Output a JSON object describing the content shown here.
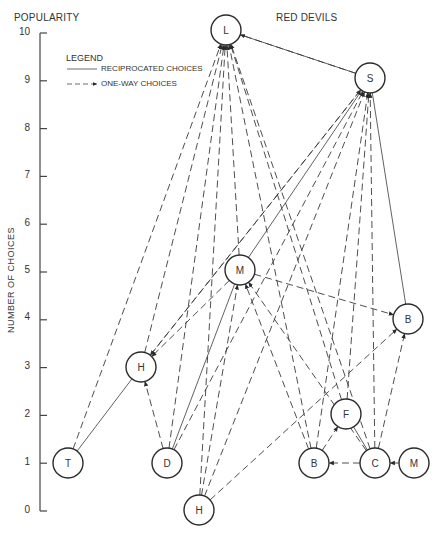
{
  "header": {
    "left_title": "POPULARITY",
    "right_title": "RED DEVILS"
  },
  "axis": {
    "title": "NUMBER OF CHOICES",
    "ticks": [
      "0",
      "1",
      "2",
      "3",
      "4",
      "5",
      "6",
      "7",
      "8",
      "9",
      "10"
    ]
  },
  "legend": {
    "title": "LEGEND",
    "reciprocated": "RECIPROCATED CHOICES",
    "one_way": "ONE-WAY CHOICES"
  },
  "nodes": [
    {
      "id": "L",
      "label": "L",
      "choices": 10
    },
    {
      "id": "S",
      "label": "S",
      "choices": 9
    },
    {
      "id": "M1",
      "label": "M",
      "choices": 5
    },
    {
      "id": "B1",
      "label": "B",
      "choices": 4
    },
    {
      "id": "H1",
      "label": "H",
      "choices": 3
    },
    {
      "id": "F",
      "label": "F",
      "choices": 2
    },
    {
      "id": "T",
      "label": "T",
      "choices": 1
    },
    {
      "id": "D",
      "label": "D",
      "choices": 1
    },
    {
      "id": "B2",
      "label": "B",
      "choices": 1
    },
    {
      "id": "C",
      "label": "C",
      "choices": 1
    },
    {
      "id": "M2",
      "label": "M",
      "choices": 1
    },
    {
      "id": "H2",
      "label": "H",
      "choices": 0
    }
  ],
  "edges": {
    "reciprocated": [
      [
        "L",
        "S"
      ],
      [
        "T",
        "H1"
      ],
      [
        "S",
        "M1"
      ],
      [
        "S",
        "B1"
      ],
      [
        "D",
        "M1"
      ],
      [
        "F",
        "C"
      ]
    ],
    "one_way": [
      [
        "T",
        "L"
      ],
      [
        "H1",
        "L"
      ],
      [
        "D",
        "L"
      ],
      [
        "H2",
        "L"
      ],
      [
        "M1",
        "L"
      ],
      [
        "B2",
        "L"
      ],
      [
        "C",
        "L"
      ],
      [
        "F",
        "L"
      ],
      [
        "S",
        "L"
      ],
      [
        "H1",
        "S"
      ],
      [
        "D",
        "S"
      ],
      [
        "H2",
        "S"
      ],
      [
        "B2",
        "S"
      ],
      [
        "C",
        "S"
      ],
      [
        "F",
        "S"
      ],
      [
        "M1",
        "H1"
      ],
      [
        "D",
        "H1"
      ],
      [
        "S",
        "H1"
      ],
      [
        "H2",
        "M1"
      ],
      [
        "B2",
        "M1"
      ],
      [
        "C",
        "M1"
      ],
      [
        "M1",
        "B1"
      ],
      [
        "H2",
        "B1"
      ],
      [
        "C",
        "B1"
      ],
      [
        "B2",
        "F"
      ],
      [
        "C",
        "B2"
      ],
      [
        "M2",
        "C"
      ]
    ]
  }
}
